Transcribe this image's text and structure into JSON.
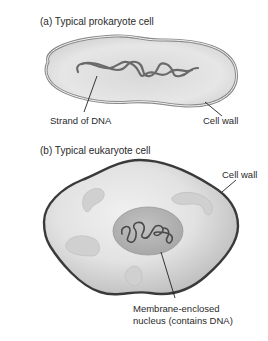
{
  "panel_a": {
    "title": "(a) Typical prokaryote cell",
    "labels": {
      "dna": "Strand of DNA",
      "cell_wall": "Cell wall"
    }
  },
  "panel_b": {
    "title": "(b) Typical eukaryote cell",
    "labels": {
      "cell_wall": "Cell wall",
      "nucleus_line1": "Membrane-enclosed",
      "nucleus_line2": "nucleus (contains DNA)"
    }
  },
  "colors": {
    "cell_fill": "#e4e4e4",
    "cell_outline_prokaryote": "#8a8a8a",
    "cell_outline_eukaryote": "#3a3a3a",
    "nucleus_fill": "#b8b8b8",
    "dna_stroke": "#555555",
    "organelle_fill": "#cfcfcf"
  }
}
